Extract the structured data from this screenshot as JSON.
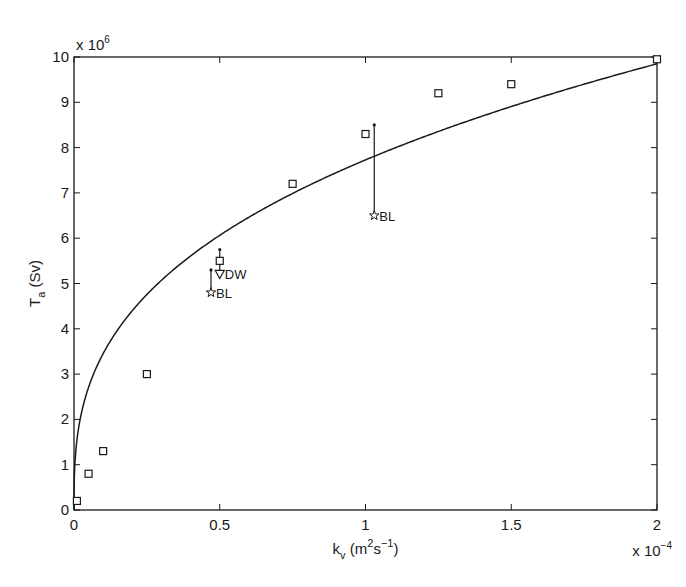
{
  "chart_data": {
    "type": "scatter",
    "title": "",
    "xlabel": "k_v (m^2 s^-1)",
    "ylabel": "T_a (Sv)",
    "x_multiplier": "x 10^-4",
    "y_multiplier": "x 10^6",
    "xlim": [
      0,
      2
    ],
    "ylim": [
      0,
      10
    ],
    "x_ticks": [
      "0",
      "0.5",
      "1",
      "1.5",
      "2"
    ],
    "y_ticks": [
      "0",
      "1",
      "2",
      "3",
      "4",
      "5",
      "6",
      "7",
      "8",
      "9",
      "10"
    ],
    "grid": false,
    "legend": null,
    "series": [
      {
        "name": "model",
        "marker": "square",
        "x": [
          0.01,
          0.05,
          0.1,
          0.25,
          0.5,
          0.75,
          1.0,
          1.25,
          1.5,
          2.0
        ],
        "y": [
          0.2,
          0.8,
          1.3,
          3.0,
          5.5,
          7.2,
          8.3,
          9.2,
          9.4,
          9.95
        ]
      },
      {
        "name": "fit curve",
        "type": "line",
        "formula": "T = 9.85 * (k/2)^0.35",
        "x": [
          0,
          0.01,
          0.03,
          0.1,
          0.25,
          0.5,
          0.75,
          1.0,
          1.25,
          1.5,
          1.75,
          2.0
        ],
        "y": [
          0,
          1.54,
          2.27,
          3.39,
          4.57,
          5.83,
          6.71,
          7.74,
          8.55,
          9.11,
          9.51,
          9.85
        ]
      },
      {
        "name": "DW",
        "marker": "triangle-down",
        "x": [
          0.5
        ],
        "y": [
          5.2
        ],
        "label": "DW"
      },
      {
        "name": "BL",
        "marker": "star",
        "x": [
          0.47,
          1.03
        ],
        "y": [
          4.8,
          6.5
        ],
        "label": "BL"
      }
    ],
    "error_bars": [
      {
        "x": 0.5,
        "y_low": 5.2,
        "y_high": 5.75,
        "series": "model"
      },
      {
        "x": 0.47,
        "y_low": 4.8,
        "y_high": 5.3,
        "series": "BL"
      },
      {
        "x": 1.03,
        "y_low": 6.5,
        "y_high": 8.5,
        "series": "BL"
      }
    ],
    "annotations": [
      "DW",
      "BL",
      "BL"
    ]
  }
}
